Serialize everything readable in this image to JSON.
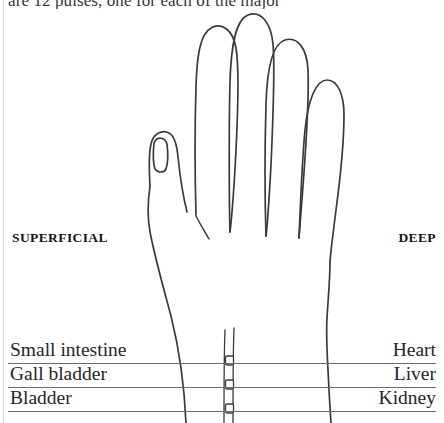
{
  "page": {
    "running_text": "are 12 pulses, one for each of the major",
    "background_color": "#ffffff",
    "ink_color": "#3a3a3a"
  },
  "figure": {
    "name": "hand-outline",
    "stroke_color": "#3a3a3a"
  },
  "headers": {
    "superficial": "SUPERFICIAL",
    "deep": "DEEP"
  },
  "rows": [
    {
      "left": "Small intestine",
      "right": "Heart"
    },
    {
      "left": "Gall bladder",
      "right": "Liver"
    },
    {
      "left": "Bladder",
      "right": "Kidney"
    }
  ]
}
